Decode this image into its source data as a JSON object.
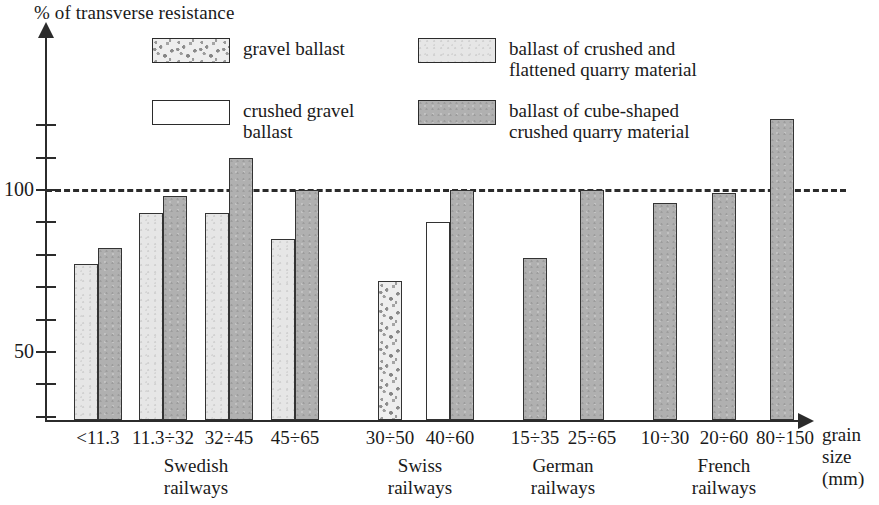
{
  "chart_data": {
    "type": "bar",
    "title": "",
    "ylabel": "% of transverse resistance",
    "xlabel": "grain size (mm)",
    "ylim": [
      29,
      130
    ],
    "yticks": [
      50,
      100
    ],
    "ytick_labels": [
      "50",
      "100"
    ],
    "grid": false,
    "reference_line": 100,
    "legend_position": "top",
    "categories": [
      "<11.3",
      "11.3÷32",
      "32÷45",
      "45÷65",
      "30÷50",
      "40÷60",
      "15÷35",
      "25÷65",
      "10÷30",
      "20÷60",
      "80÷150"
    ],
    "groups": [
      {
        "label": "Swedish\nrailways",
        "categories": [
          "<11.3",
          "11.3÷32",
          "32÷45",
          "45÷65"
        ]
      },
      {
        "label": "Swiss\nrailways",
        "categories": [
          "30÷50",
          "40÷60"
        ]
      },
      {
        "label": "German\nrailways",
        "categories": [
          "15÷35",
          "25÷65"
        ]
      },
      {
        "label": "French\nrailways",
        "categories": [
          "10÷30",
          "20÷60",
          "80÷150"
        ]
      }
    ],
    "series": [
      {
        "name": "gravel ballast",
        "fill": "gravel",
        "values": [
          null,
          null,
          null,
          null,
          72,
          null,
          null,
          null,
          null,
          null,
          null
        ]
      },
      {
        "name": "crushed gravel ballast",
        "fill": "white",
        "values": [
          null,
          null,
          null,
          null,
          null,
          90,
          null,
          null,
          null,
          null,
          null
        ]
      },
      {
        "name": "ballast of crushed and flattened quarry material",
        "fill": "light",
        "values": [
          77,
          93,
          93,
          85,
          null,
          null,
          null,
          null,
          null,
          null,
          null
        ]
      },
      {
        "name": "ballast of cube-shaped crushed quarry material",
        "fill": "dark",
        "values": [
          82,
          98,
          110,
          100,
          null,
          100,
          79,
          100,
          96,
          99,
          122
        ]
      }
    ],
    "bars": [
      {
        "category": "<11.3",
        "series": "ballast of crushed and flattened quarry material",
        "fill": "light",
        "value": 77,
        "x": 74,
        "w": 24
      },
      {
        "category": "<11.3",
        "series": "ballast of cube-shaped crushed quarry material",
        "fill": "dark",
        "value": 82,
        "x": 98,
        "w": 24
      },
      {
        "category": "11.3÷32",
        "series": "ballast of crushed and flattened quarry material",
        "fill": "light",
        "value": 93,
        "x": 139,
        "w": 24
      },
      {
        "category": "11.3÷32",
        "series": "ballast of cube-shaped crushed quarry material",
        "fill": "dark",
        "value": 98,
        "x": 163,
        "w": 24
      },
      {
        "category": "32÷45",
        "series": "ballast of crushed and flattened quarry material",
        "fill": "light",
        "value": 93,
        "x": 205,
        "w": 24
      },
      {
        "category": "32÷45",
        "series": "ballast of cube-shaped crushed quarry material",
        "fill": "dark",
        "value": 110,
        "x": 229,
        "w": 24
      },
      {
        "category": "45÷65",
        "series": "ballast of crushed and flattened quarry material",
        "fill": "light",
        "value": 85,
        "x": 271,
        "w": 24
      },
      {
        "category": "45÷65",
        "series": "ballast of cube-shaped crushed quarry material",
        "fill": "dark",
        "value": 100,
        "x": 295,
        "w": 24
      },
      {
        "category": "30÷50",
        "series": "gravel ballast",
        "fill": "gravel",
        "value": 72,
        "x": 378,
        "w": 24
      },
      {
        "category": "40÷60",
        "series": "crushed gravel ballast",
        "fill": "white",
        "value": 90,
        "x": 426,
        "w": 24
      },
      {
        "category": "40÷60",
        "series": "ballast of cube-shaped crushed quarry material",
        "fill": "dark",
        "value": 100,
        "x": 450,
        "w": 24
      },
      {
        "category": "15÷35",
        "series": "ballast of cube-shaped crushed quarry material",
        "fill": "dark",
        "value": 79,
        "x": 523,
        "w": 24
      },
      {
        "category": "25÷65",
        "series": "ballast of cube-shaped crushed quarry material",
        "fill": "dark",
        "value": 100,
        "x": 580,
        "w": 24
      },
      {
        "category": "10÷30",
        "series": "ballast of cube-shaped crushed quarry material",
        "fill": "dark",
        "value": 96,
        "x": 653,
        "w": 24
      },
      {
        "category": "20÷60",
        "series": "ballast of cube-shaped crushed quarry material",
        "fill": "dark",
        "value": 99,
        "x": 712,
        "w": 24
      },
      {
        "category": "80÷150",
        "series": "ballast of cube-shaped crushed quarry material",
        "fill": "dark",
        "value": 122,
        "x": 770,
        "w": 24
      }
    ]
  },
  "axes": {
    "y_title": "% of transverse resistance",
    "x_title": "grain\nsize\n(mm)",
    "y_labels": [
      {
        "text": "100",
        "value": 100
      },
      {
        "text": "50",
        "value": 50
      }
    ]
  },
  "x_labels": [
    {
      "text": "<11.3",
      "center": 98
    },
    {
      "text": "11.3÷32",
      "center": 163
    },
    {
      "text": "32÷45",
      "center": 229
    },
    {
      "text": "45÷65",
      "center": 295
    },
    {
      "text": "30÷50",
      "center": 390
    },
    {
      "text": "40÷60",
      "center": 450
    },
    {
      "text": "15÷35",
      "center": 535
    },
    {
      "text": "25÷65",
      "center": 592
    },
    {
      "text": "10÷30",
      "center": 665
    },
    {
      "text": "20÷60",
      "center": 724
    },
    {
      "text": "80÷150",
      "center": 785
    }
  ],
  "group_labels": [
    {
      "line1": "Swedish",
      "line2": "railways",
      "center": 196
    },
    {
      "line1": "Swiss",
      "line2": "railways",
      "center": 420
    },
    {
      "line1": "German",
      "line2": "railways",
      "center": 563
    },
    {
      "line1": "French",
      "line2": "railways",
      "center": 724
    }
  ],
  "legend": {
    "items": [
      {
        "label": "gravel ballast",
        "fill": "gravel",
        "left": 152,
        "top": 38,
        "two_line": false
      },
      {
        "label": "ballast of crushed and\nflattened quarry material",
        "fill": "light",
        "left": 418,
        "top": 38,
        "two_line": true
      },
      {
        "label": "crushed gravel\nballast",
        "fill": "white",
        "left": 152,
        "top": 100,
        "two_line": true
      },
      {
        "label": "ballast of cube-shaped\ncrushed quarry material",
        "fill": "dark",
        "left": 418,
        "top": 100,
        "two_line": true
      }
    ]
  },
  "colors": {
    "axis": "#2b2b2b",
    "light_fill": "#e6e6e6",
    "dark_fill": "#b0b0b0",
    "gravel_fill": "#eeeeee",
    "white_fill": "#ffffff",
    "background": "#ffffff"
  }
}
